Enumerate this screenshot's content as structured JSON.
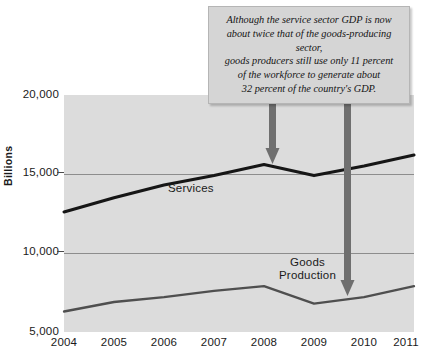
{
  "chart_data": {
    "type": "line",
    "title": "",
    "xlabel": "",
    "ylabel": "Billions",
    "categories": [
      "2004",
      "2005",
      "2006",
      "2007",
      "2008",
      "2009",
      "2010",
      "2011"
    ],
    "x": [
      2004,
      2005,
      2006,
      2007,
      2008,
      2009,
      2010,
      2011
    ],
    "ylim": [
      5000,
      20000
    ],
    "yticks": [
      "5,000",
      "10,000",
      "15,000",
      "20,000"
    ],
    "ytick_values": [
      5000,
      10000,
      15000,
      20000
    ],
    "grid": true,
    "legend_position": "inline-series-labels",
    "series": [
      {
        "name": "Services",
        "values": [
          12600,
          13500,
          14300,
          14900,
          15600,
          14900,
          15500,
          16200
        ]
      },
      {
        "name": "Goods Production",
        "values": [
          6300,
          6900,
          7200,
          7600,
          7900,
          6800,
          7200,
          7900
        ]
      }
    ],
    "annotations": [
      {
        "name": "callout",
        "text": "Although the service sector GDP is now\nabout twice that of the goods-producing sector,\ngoods producers still use only 11 percent\nof the workforce to generate about\n32 percent of the country's GDP.",
        "arrows": [
          {
            "target_series": "Services",
            "target_x": 2008
          },
          {
            "target_series": "Goods Production",
            "target_x": 2010
          }
        ]
      }
    ],
    "colors": {
      "plot_background": "#dcdcdc",
      "gridline": "#8d8d8d",
      "services_line": "#161616",
      "goods_line": "#4f4f4f",
      "arrow": "#6f6f6f",
      "callout_background": "#d5d5d5",
      "text": "#1a1a1a"
    }
  },
  "axis": {
    "y_title": "Billions",
    "y_ticks": [
      {
        "label": "20,000"
      },
      {
        "label": "15,000"
      },
      {
        "label": "10,000"
      },
      {
        "label": "5,000"
      }
    ],
    "x_ticks": [
      {
        "label": "2004"
      },
      {
        "label": "2005"
      },
      {
        "label": "2006"
      },
      {
        "label": "2007"
      },
      {
        "label": "2008"
      },
      {
        "label": "2009"
      },
      {
        "label": "2010"
      },
      {
        "label": "2011"
      }
    ]
  },
  "series_labels": {
    "services": "Services",
    "goods_line1": "Goods",
    "goods_line2": "Production"
  },
  "callout": {
    "text": "Although the service sector GDP is now\nabout twice that of the goods-producing sector,\ngoods producers still use only 11 percent\nof the workforce to generate about\n32 percent of the country's GDP."
  }
}
